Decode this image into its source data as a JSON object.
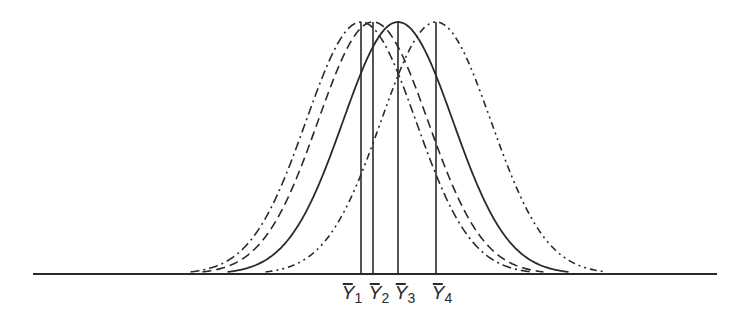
{
  "chart_data": {
    "type": "line",
    "title": "",
    "xlabel": "",
    "ylabel": "",
    "grid": false,
    "legend": null,
    "baseline": {
      "x_start": 33,
      "x_end": 717,
      "y": 274
    },
    "peak_y": 22,
    "sigma_px": 55,
    "series": [
      {
        "name": "Y1",
        "label": "Y̅₁",
        "mean_px": 361,
        "line_style": "dash-dot",
        "dasharray": "9 4 2 4"
      },
      {
        "name": "Y2",
        "label": "Y̅₂",
        "mean_px": 373,
        "line_style": "dashed",
        "dasharray": "9 5"
      },
      {
        "name": "Y3",
        "label": "Y̅₃",
        "mean_px": 398,
        "line_style": "solid",
        "dasharray": ""
      },
      {
        "name": "Y4",
        "label": "Y̅₄",
        "mean_px": 436,
        "line_style": "dash-dot-dot",
        "dasharray": "7 4 2 4 2 4"
      }
    ],
    "annotations": [
      "Y̅₁",
      "Y̅₂",
      "Y̅₃",
      "Y̅₄"
    ]
  },
  "labels": [
    {
      "sym": "Y",
      "sub": "1",
      "x": 352
    },
    {
      "sym": "Y",
      "sub": "2",
      "x": 379
    },
    {
      "sym": "Y",
      "sub": "3",
      "x": 405
    },
    {
      "sym": "Y",
      "sub": "4",
      "x": 442
    }
  ],
  "colors": {
    "stroke": "#2a2a2a",
    "background": "#ffffff"
  }
}
